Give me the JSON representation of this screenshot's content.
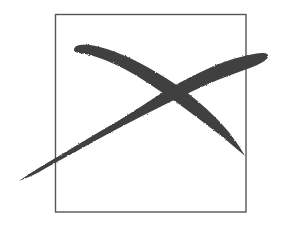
{
  "figure": {
    "background_color": "#ffffff",
    "box": {
      "x": 55,
      "y": 14,
      "width": 191,
      "height": 198,
      "stroke_color": "#555555",
      "stroke_width": 1.4
    },
    "x_mark": {
      "color": "#3f3f3f",
      "stroke_a": {
        "name": "upper-left-to-lower-right stroke",
        "start": [
          73,
          47
        ],
        "end": [
          245,
          156
        ]
      },
      "stroke_b": {
        "name": "lower-left-to-upper-right stroke",
        "start": [
          19,
          181
        ],
        "end": [
          268,
          56
        ]
      }
    }
  }
}
